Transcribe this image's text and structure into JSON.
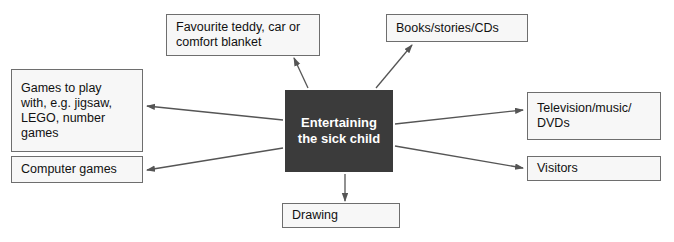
{
  "diagram": {
    "title": "Entertaining the sick child",
    "type": "spider-diagram",
    "center": {
      "id": "center",
      "label": "Entertaining\nthe sick child",
      "fill": "#3b3b3b",
      "text_color": "#ffffff"
    },
    "nodes": [
      {
        "id": "teddy",
        "label": "Favourite teddy, car or\ncomfort blanket",
        "position": "top-left"
      },
      {
        "id": "books",
        "label": "Books/stories/CDs",
        "position": "top-right"
      },
      {
        "id": "games",
        "label": "Games to play\nwith, e.g. jigsaw,\nLEGO, number\ngames",
        "position": "left-upper"
      },
      {
        "id": "tv",
        "label": "Television/music/\nDVDs",
        "position": "right-upper"
      },
      {
        "id": "computer",
        "label": "Computer games",
        "position": "left-lower"
      },
      {
        "id": "visitors",
        "label": "Visitors",
        "position": "right-lower"
      },
      {
        "id": "drawing",
        "label": "Drawing",
        "position": "bottom"
      }
    ],
    "edges": [
      {
        "from": "center",
        "to": "teddy",
        "direction": "outward"
      },
      {
        "from": "center",
        "to": "books",
        "direction": "outward"
      },
      {
        "from": "center",
        "to": "games",
        "direction": "outward"
      },
      {
        "from": "center",
        "to": "tv",
        "direction": "outward"
      },
      {
        "from": "center",
        "to": "computer",
        "direction": "outward"
      },
      {
        "from": "center",
        "to": "visitors",
        "direction": "outward"
      },
      {
        "from": "center",
        "to": "drawing",
        "direction": "outward"
      }
    ],
    "colors": {
      "page_background": "#ffffff",
      "node_fill": "#f7f7f7",
      "node_border": "#6e6e6e",
      "center_fill": "#3b3b3b",
      "center_text": "#ffffff",
      "arrow": "#555555",
      "text": "#111111"
    }
  }
}
